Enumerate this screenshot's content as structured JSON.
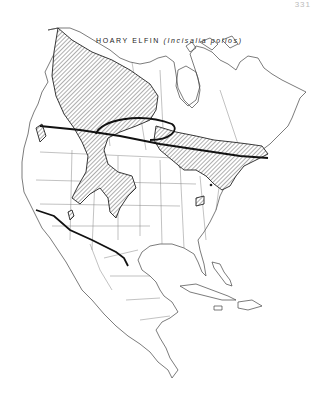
{
  "page": {
    "page_number": "331"
  },
  "map": {
    "title": "HOARY ELFIN",
    "scientific_name": "(Incisalia polios)",
    "region": "North America",
    "legend": {
      "hatched_area": "species range",
      "heavy_line": "range boundary"
    },
    "colors": {
      "ink": "#222222",
      "paper": "#ffffff"
    }
  }
}
